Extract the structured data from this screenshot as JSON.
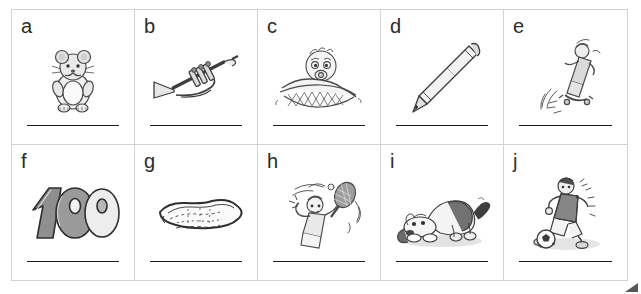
{
  "worksheet": {
    "title": "Picture vocabulary worksheet",
    "columns": 5,
    "rows": 2,
    "grid_color": "#d2d2d2",
    "line_color": "#1a1a1a",
    "label_color": "#2b2b2b",
    "background": "#ffffff"
  },
  "cells": [
    {
      "label": "a",
      "icon": "hamster-icon",
      "picture": "hamster",
      "answer_value": ""
    },
    {
      "label": "b",
      "icon": "trumpet-icon",
      "picture": "trumpet",
      "answer_value": ""
    },
    {
      "label": "c",
      "icon": "baby-icon",
      "picture": "baby in blanket",
      "answer_value": ""
    },
    {
      "label": "d",
      "icon": "pencil-icon",
      "picture": "pencil",
      "answer_value": ""
    },
    {
      "label": "e",
      "icon": "skateboard-icon",
      "picture": "skateboarder",
      "answer_value": ""
    },
    {
      "label": "f",
      "icon": "hundred-icon",
      "picture": "100",
      "answer_value": ""
    },
    {
      "label": "g",
      "icon": "puddle-icon",
      "picture": "puddle",
      "answer_value": ""
    },
    {
      "label": "h",
      "icon": "tennis-icon",
      "picture": "tennis player",
      "answer_value": ""
    },
    {
      "label": "i",
      "icon": "dog-icon",
      "picture": "dog",
      "answer_value": ""
    },
    {
      "label": "j",
      "icon": "soccer-icon",
      "picture": "soccer player",
      "answer_value": ""
    }
  ],
  "corner": {
    "mark": "page-corner-mark"
  }
}
